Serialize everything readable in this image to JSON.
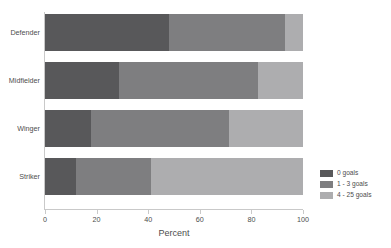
{
  "chart_data": {
    "type": "bar",
    "orientation": "horizontal",
    "stacked": true,
    "stack_mode": "percent",
    "title": "",
    "subtitle": "",
    "xlabel": "Percent",
    "ylabel": "",
    "xlim": [
      0,
      100
    ],
    "xticks": [
      0,
      20,
      40,
      60,
      80,
      100
    ],
    "xtick_labels": [
      "0",
      "20",
      "40",
      "60",
      "80",
      "100"
    ],
    "grid": false,
    "legend_position": "right",
    "categories": [
      "Defender",
      "Midfielder",
      "Winger",
      "Striker"
    ],
    "series": [
      {
        "name": "0 goals",
        "color": "#58585a",
        "values": [
          48.0,
          28.7,
          17.8,
          12.0
        ]
      },
      {
        "name": "1 - 3 goals",
        "color": "#7e7e80",
        "values": [
          45.0,
          53.8,
          53.5,
          29.0
        ]
      },
      {
        "name": "4 - 25 goals",
        "color": "#adadaf",
        "values": [
          7.0,
          17.5,
          28.7,
          59.0
        ]
      }
    ],
    "cumulative_boundaries": [
      [
        48.0,
        93.0,
        100.0
      ],
      [
        28.7,
        82.5,
        100.0
      ],
      [
        17.8,
        71.3,
        100.0
      ],
      [
        12.0,
        41.0,
        100.0
      ]
    ]
  },
  "legend": {
    "items": [
      {
        "label": "0 goals",
        "color": "#58585a"
      },
      {
        "label": "1 - 3 goals",
        "color": "#7e7e80"
      },
      {
        "label": "4 - 25 goals",
        "color": "#adadaf"
      }
    ]
  },
  "axis": {
    "x_title": "Percent",
    "tick_labels": [
      "0",
      "20",
      "40",
      "60",
      "80",
      "100"
    ]
  },
  "colors": {
    "background": "#ffffff",
    "axis_line": "#c9c9c9",
    "text": "#4d4d4d",
    "series_0": "#58585a",
    "series_1": "#7e7e80",
    "series_2": "#adadaf"
  }
}
